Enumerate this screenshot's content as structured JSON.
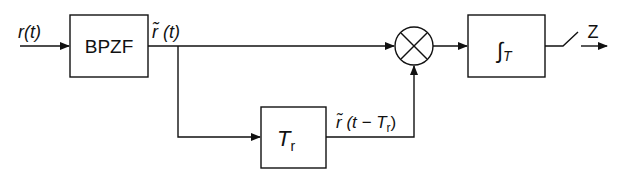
{
  "diagram": {
    "input_label": "r(t)",
    "blocks": {
      "bandpass": {
        "label": "BPZF"
      },
      "delay": {
        "label_main": "T",
        "label_sub": "r"
      },
      "multiplier": {
        "symbol": "×"
      },
      "integrator": {
        "label_main": "∫",
        "label_sub": "T"
      }
    },
    "signals": {
      "filtered": "r̃ (t)",
      "delayed_prefix": "r̃ (t − T",
      "delayed_sub": "r",
      "delayed_suffix": ")"
    },
    "output_label": "Z"
  }
}
